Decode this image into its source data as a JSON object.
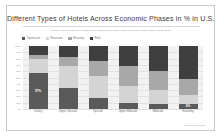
{
  "card": {
    "title": "Different Types of Hotels Across Economic Phases in % in U.S.",
    "subtitle": "Weekly Hotel Revenue per Available Room / Star Rank Inventory, Indexed to all U.S. Hotels Listing April 24, 2021",
    "source_note": "Source: STR (2021)"
  },
  "legend": {
    "items": [
      {
        "label": "Depression",
        "color": "#5a5a5a"
      },
      {
        "label": "Recession",
        "color": "#d4d4d4"
      },
      {
        "label": "Recovery",
        "color": "#a8a8a8"
      },
      {
        "label": "Peak",
        "color": "#3f3f3f"
      }
    ]
  },
  "chart_data": {
    "type": "bar",
    "title": "Different Types of Hotels Across Economic Phases in % in U.S.",
    "subtitle": "Weekly Hotel Revenue per Available Room / Star Rank Inventory, Indexed to all U.S. Hotels Listing April 24, 2021",
    "xlabel": "",
    "ylabel": "",
    "ylim": [
      0,
      100
    ],
    "ytick_labels": [
      "100%",
      "90%",
      "80%",
      "70%",
      "60%",
      "50%",
      "40%",
      "30%",
      "20%",
      "10%",
      "0%"
    ],
    "grid": true,
    "stacked": true,
    "stack_total": 100,
    "legend_position": "top-left",
    "categories": [
      "Luxury",
      "Upper Upscale",
      "Upscale",
      "Upper Midscale",
      "Midscale",
      "Economy"
    ],
    "series": [
      {
        "name": "Depression",
        "color": "#5a5a5a",
        "values": [
          57,
          33,
          18,
          9,
          8,
          8
        ]
      },
      {
        "name": "Recession",
        "color": "#d4d4d4",
        "values": [
          22,
          36,
          34,
          28,
          22,
          14
        ]
      },
      {
        "name": "Recovery",
        "color": "#a8a8a8",
        "values": [
          7,
          13,
          24,
          31,
          30,
          25
        ]
      },
      {
        "name": "Peak",
        "color": "#3f3f3f",
        "values": [
          14,
          18,
          24,
          32,
          40,
          53
        ]
      }
    ],
    "data_labels": [
      {
        "category": "Luxury",
        "series": "Depression",
        "text": "57%"
      },
      {
        "category": "Economy",
        "series": "Depression",
        "text": "8%"
      }
    ]
  },
  "axis": {
    "y_ticks": [
      "100%",
      "90%",
      "80%",
      "70%",
      "60%",
      "50%",
      "40%",
      "30%",
      "20%",
      "10%",
      "0%"
    ]
  }
}
